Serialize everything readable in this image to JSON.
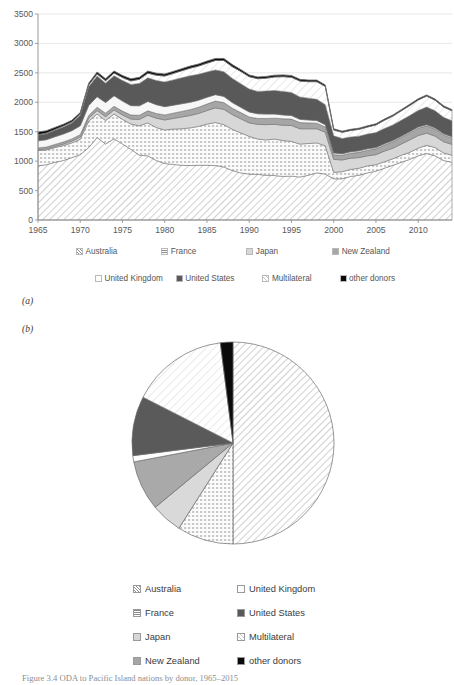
{
  "figure": {
    "panel_a_tag": "(a)",
    "panel_b_tag": "(b)",
    "caption": "Figure 3.4 ODA to Pacific Island nations by donor, 1965–2015"
  },
  "area_legend": {
    "row1": [
      {
        "label": "Australia",
        "pattern": "diag-hatch-light",
        "color": "#ffffff"
      },
      {
        "label": "France",
        "pattern": "dot-grid",
        "color": "#ffffff"
      },
      {
        "label": "Japan",
        "pattern": "solid",
        "color": "#d7d7d7"
      },
      {
        "label": "New Zealand",
        "pattern": "solid",
        "color": "#a6a6a6"
      }
    ],
    "row2": [
      {
        "label": "United Kingdom",
        "pattern": "solid",
        "color": "#f7f7f7"
      },
      {
        "label": "United States",
        "pattern": "solid",
        "color": "#595959"
      },
      {
        "label": "Multilateral",
        "pattern": "diag-hatch-faint",
        "color": "#ffffff"
      },
      {
        "label": "other donors",
        "pattern": "solid",
        "color": "#000000"
      }
    ]
  },
  "pie_legend": {
    "left": [
      "Australia",
      "France",
      "Japan",
      "New Zealand"
    ],
    "right": [
      "United Kingdom",
      "United States",
      "Multilateral",
      "other donors"
    ]
  },
  "chart_data": [
    {
      "type": "area",
      "stacked": true,
      "title": "",
      "xlabel": "",
      "ylabel": "",
      "xlim": [
        1965,
        2014
      ],
      "ylim": [
        0,
        3500
      ],
      "ytick_labels": [
        "0",
        "500",
        "1000",
        "1500",
        "2000",
        "2500",
        "3000",
        "3500"
      ],
      "yticks": [
        0,
        500,
        1000,
        1500,
        2000,
        2500,
        3000,
        3500
      ],
      "xtick_labels": [
        "1965",
        "1970",
        "1975",
        "1980",
        "1985",
        "1990",
        "1995",
        "2000",
        "2005",
        "2010"
      ],
      "xticks": [
        1965,
        1970,
        1975,
        1980,
        1985,
        1990,
        1995,
        2000,
        2005,
        2010
      ],
      "grid": true,
      "legend_position": "bottom",
      "x": [
        1965,
        1966,
        1967,
        1968,
        1969,
        1970,
        1971,
        1972,
        1973,
        1974,
        1975,
        1976,
        1977,
        1978,
        1979,
        1980,
        1981,
        1982,
        1983,
        1984,
        1985,
        1986,
        1987,
        1988,
        1989,
        1990,
        1991,
        1992,
        1993,
        1994,
        1995,
        1996,
        1997,
        1998,
        1999,
        2000,
        2001,
        2002,
        2003,
        2004,
        2005,
        2006,
        2007,
        2008,
        2009,
        2010,
        2011,
        2012,
        2013,
        2014
      ],
      "series": [
        {
          "name": "Australia",
          "values": [
            920,
            940,
            980,
            1010,
            1060,
            1110,
            1230,
            1400,
            1290,
            1380,
            1290,
            1200,
            1100,
            1090,
            1010,
            960,
            945,
            930,
            925,
            930,
            930,
            925,
            900,
            840,
            800,
            780,
            775,
            760,
            755,
            740,
            745,
            730,
            760,
            800,
            780,
            700,
            700,
            740,
            760,
            800,
            830,
            880,
            930,
            980,
            1030,
            1090,
            1130,
            1090,
            1010,
            980
          ]
        },
        {
          "name": "France",
          "values": [
            260,
            250,
            250,
            255,
            250,
            260,
            450,
            400,
            400,
            420,
            420,
            430,
            500,
            560,
            560,
            570,
            600,
            620,
            640,
            660,
            700,
            730,
            720,
            700,
            680,
            640,
            600,
            600,
            620,
            610,
            590,
            560,
            540,
            510,
            480,
            110,
            120,
            120,
            120,
            120,
            110,
            110,
            110,
            120,
            120,
            130,
            140,
            140,
            130,
            120
          ]
        },
        {
          "name": "Japan",
          "values": [
            15,
            18,
            20,
            25,
            30,
            40,
            50,
            60,
            65,
            70,
            75,
            85,
            110,
            130,
            160,
            170,
            180,
            200,
            210,
            220,
            230,
            250,
            260,
            250,
            240,
            230,
            250,
            260,
            250,
            260,
            270,
            260,
            250,
            240,
            230,
            220,
            200,
            190,
            180,
            170,
            170,
            180,
            180,
            190,
            210,
            215,
            205,
            195,
            190,
            185
          ]
        },
        {
          "name": "New Zealand",
          "values": [
            30,
            32,
            34,
            36,
            38,
            40,
            45,
            55,
            60,
            62,
            65,
            68,
            70,
            75,
            80,
            85,
            90,
            95,
            100,
            105,
            110,
            115,
            115,
            110,
            105,
            100,
            100,
            105,
            105,
            110,
            110,
            105,
            100,
            95,
            90,
            80,
            80,
            85,
            90,
            95,
            100,
            105,
            110,
            115,
            120,
            125,
            125,
            120,
            115,
            110
          ]
        },
        {
          "name": "United Kingdom",
          "values": [
            120,
            125,
            130,
            135,
            140,
            150,
            170,
            180,
            180,
            180,
            170,
            160,
            160,
            160,
            150,
            140,
            135,
            130,
            125,
            120,
            115,
            110,
            105,
            95,
            90,
            85,
            80,
            75,
            70,
            65,
            60,
            55,
            50,
            45,
            40,
            30,
            25,
            25,
            25,
            25,
            20,
            20,
            20,
            20,
            20,
            20,
            20,
            20,
            20,
            20
          ]
        },
        {
          "name": "United States",
          "values": [
            95,
            100,
            110,
            120,
            130,
            180,
            320,
            350,
            330,
            340,
            350,
            360,
            380,
            400,
            410,
            420,
            430,
            440,
            450,
            440,
            430,
            420,
            420,
            410,
            400,
            390,
            380,
            390,
            400,
            400,
            390,
            380,
            370,
            360,
            340,
            290,
            260,
            250,
            250,
            250,
            255,
            260,
            265,
            270,
            275,
            280,
            300,
            290,
            280,
            270
          ]
        },
        {
          "name": "Multilateral",
          "values": [
            10,
            12,
            14,
            16,
            18,
            20,
            30,
            35,
            40,
            45,
            50,
            60,
            70,
            80,
            90,
            100,
            110,
            120,
            130,
            140,
            150,
            160,
            190,
            200,
            210,
            210,
            215,
            220,
            230,
            250,
            260,
            270,
            280,
            300,
            310,
            100,
            105,
            110,
            115,
            120,
            130,
            140,
            150,
            160,
            170,
            180,
            185,
            180,
            175,
            170
          ]
        },
        {
          "name": "other donors",
          "values": [
            45,
            40,
            35,
            30,
            28,
            25,
            30,
            35,
            35,
            35,
            35,
            35,
            35,
            35,
            35,
            35,
            35,
            35,
            35,
            35,
            35,
            35,
            35,
            35,
            30,
            30,
            30,
            30,
            30,
            30,
            30,
            30,
            28,
            28,
            25,
            20,
            20,
            20,
            20,
            20,
            20,
            20,
            20,
            20,
            20,
            20,
            20,
            20,
            20,
            20
          ]
        }
      ]
    },
    {
      "type": "pie",
      "title": "",
      "start_angle_deg": 0,
      "direction": "clockwise",
      "labels": [
        "Australia",
        "France",
        "Japan",
        "New Zealand",
        "United Kingdom",
        "United States",
        "Multilateral",
        "other donors"
      ],
      "values": [
        50.0,
        9.0,
        5.0,
        8.0,
        1.0,
        9.5,
        15.5,
        2.0
      ],
      "legend_position": "bottom"
    }
  ]
}
